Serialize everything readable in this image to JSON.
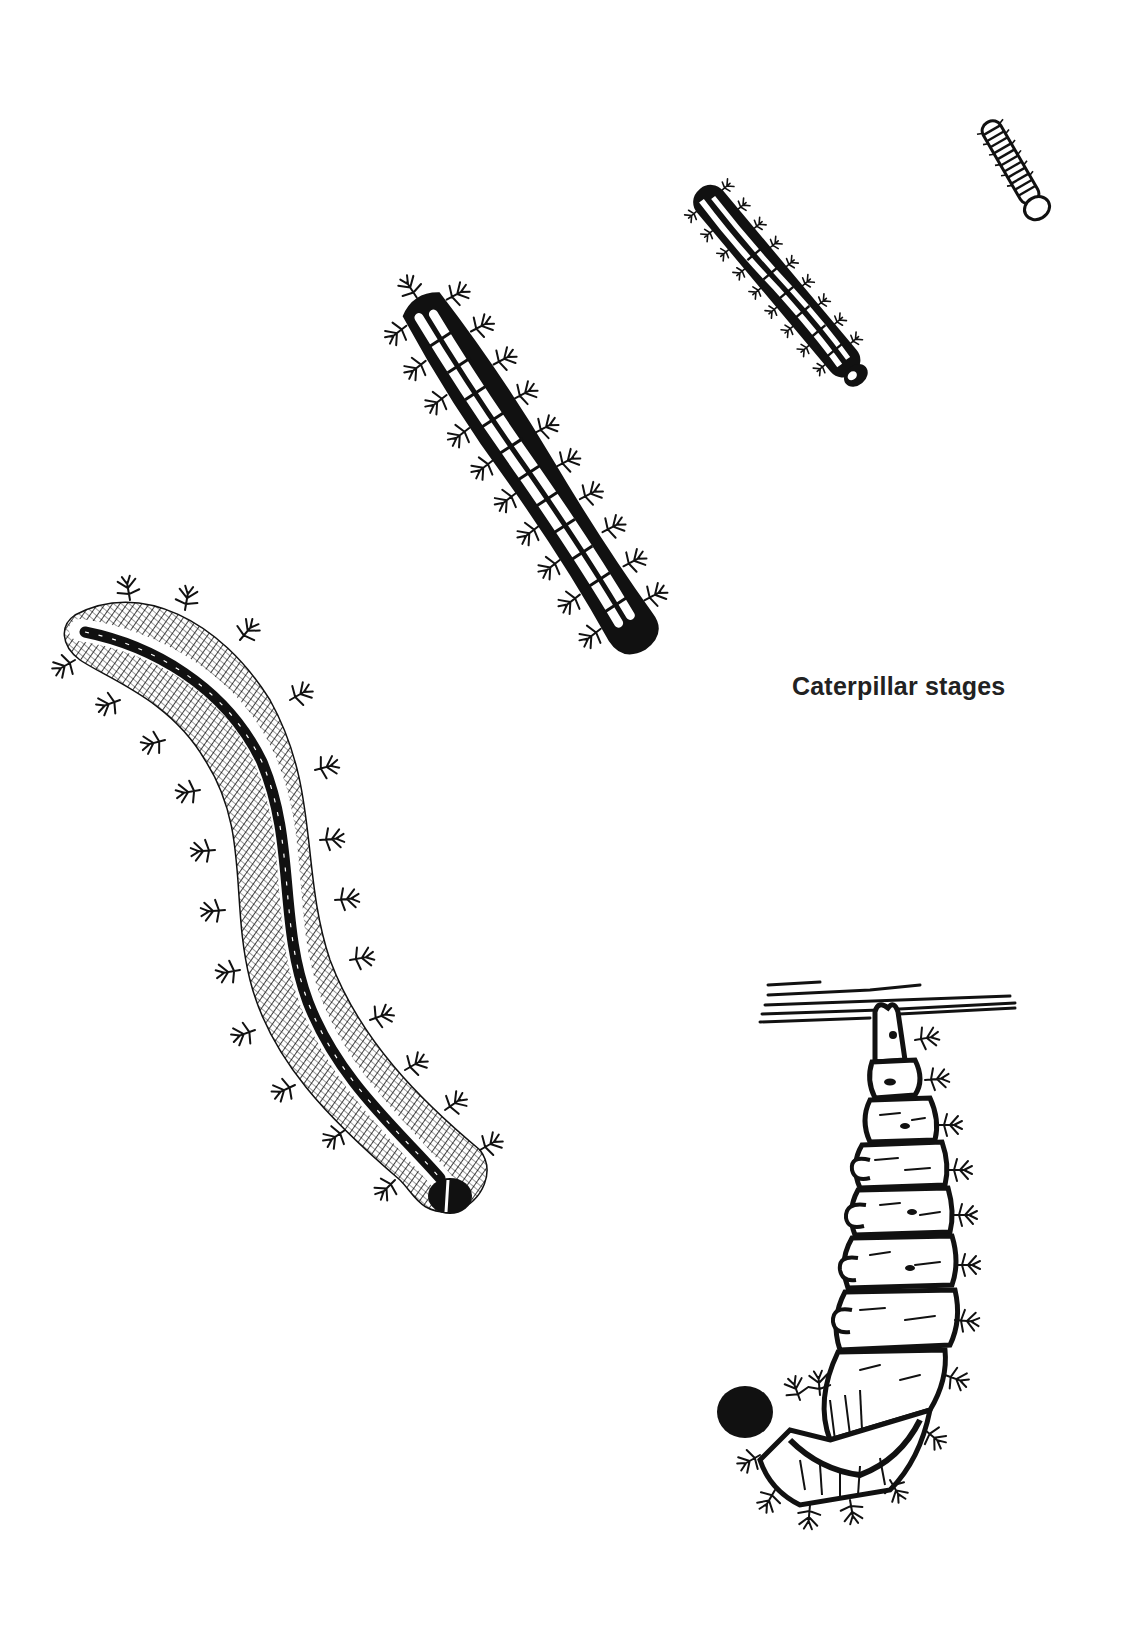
{
  "page": {
    "background": "#ffffff",
    "ink_color": "#111111"
  },
  "caption": {
    "text": "Caterpillar stages",
    "color": "#222222"
  },
  "illustration": {
    "title": "Caterpillar stages",
    "figures": [
      {
        "id": "stage-1",
        "description": "Smallest caterpillar, segmented, pale round head",
        "position": "top-right"
      },
      {
        "id": "stage-2",
        "description": "Small spiny caterpillar with pale dorsal stripes",
        "position": "upper-right"
      },
      {
        "id": "stage-3",
        "description": "Medium black spiny caterpillar with white segmented stripe",
        "position": "upper-center"
      },
      {
        "id": "stage-4",
        "description": "Large hairy spiny caterpillar with dark dorsal line",
        "position": "left"
      },
      {
        "id": "stage-5",
        "description": "Caterpillar hanging in J-shape from a twig before pupation",
        "position": "bottom-right"
      }
    ]
  }
}
